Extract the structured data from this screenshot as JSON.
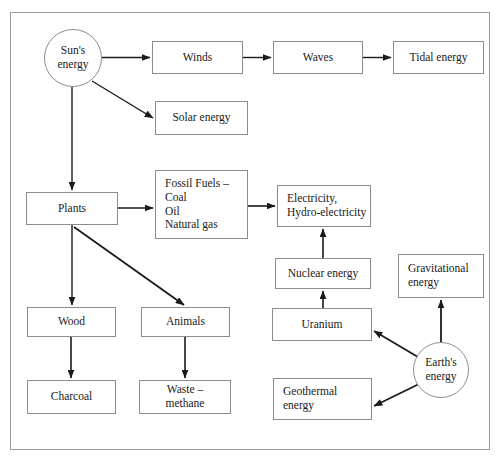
{
  "diagram": {
    "type": "flowchart",
    "background_color": "#ffffff",
    "frame_color": "#9a9a9a",
    "node_border_color": "#8d8d8d",
    "text_color": "#1a1a1a",
    "arrow_color": "#1a1a1a",
    "nodes": [
      {
        "id": "suns-energy",
        "label": "Sun's\nenergy",
        "shape": "ellipse",
        "x": 44,
        "y": 29,
        "w": 58,
        "h": 58,
        "font_size": 11.5,
        "align": "center"
      },
      {
        "id": "winds",
        "label": "Winds",
        "shape": "box",
        "x": 152,
        "y": 41,
        "w": 91,
        "h": 33,
        "font_size": 11.5,
        "align": "center"
      },
      {
        "id": "waves",
        "label": "Waves",
        "shape": "box",
        "x": 273,
        "y": 41,
        "w": 90,
        "h": 33,
        "font_size": 11.5,
        "align": "center"
      },
      {
        "id": "tidal-energy",
        "label": "Tidal energy",
        "shape": "box",
        "x": 393,
        "y": 41,
        "w": 91,
        "h": 33,
        "font_size": 11.5,
        "align": "center"
      },
      {
        "id": "solar-energy",
        "label": "Solar energy",
        "shape": "box",
        "x": 155,
        "y": 101,
        "w": 93,
        "h": 34,
        "font_size": 11.5,
        "align": "center"
      },
      {
        "id": "plants",
        "label": "Plants",
        "shape": "box",
        "x": 26,
        "y": 192,
        "w": 92,
        "h": 33,
        "font_size": 11.5,
        "align": "center"
      },
      {
        "id": "fossil-fuels",
        "label": "Fossil Fuels –\nCoal\nOil\nNatural gas",
        "shape": "box",
        "x": 155,
        "y": 170,
        "w": 93,
        "h": 69,
        "font_size": 11.5,
        "align": "left"
      },
      {
        "id": "electricity",
        "label": "Electricity,\nHydro-electricity",
        "shape": "box",
        "x": 277,
        "y": 185,
        "w": 94,
        "h": 42,
        "font_size": 11.5,
        "align": "left"
      },
      {
        "id": "nuclear-energy",
        "label": "Nuclear energy",
        "shape": "box",
        "x": 275,
        "y": 258,
        "w": 96,
        "h": 31,
        "font_size": 11.5,
        "align": "center"
      },
      {
        "id": "gravitational",
        "label": "Gravitational\nenergy",
        "shape": "box",
        "x": 398,
        "y": 254,
        "w": 86,
        "h": 44,
        "font_size": 11.5,
        "align": "left"
      },
      {
        "id": "uranium",
        "label": "Uranium",
        "shape": "box",
        "x": 272,
        "y": 308,
        "w": 100,
        "h": 33,
        "font_size": 11.5,
        "align": "center"
      },
      {
        "id": "wood",
        "label": "Wood",
        "shape": "box",
        "x": 27,
        "y": 307,
        "w": 89,
        "h": 30,
        "font_size": 11.5,
        "align": "center"
      },
      {
        "id": "animals",
        "label": "Animals",
        "shape": "box",
        "x": 141,
        "y": 307,
        "w": 89,
        "h": 30,
        "font_size": 11.5,
        "align": "center"
      },
      {
        "id": "earths-energy",
        "label": "Earth's\nenergy",
        "shape": "ellipse",
        "x": 413,
        "y": 342,
        "w": 56,
        "h": 56,
        "font_size": 11.5,
        "align": "center"
      },
      {
        "id": "charcoal",
        "label": "Charcoal",
        "shape": "box",
        "x": 27,
        "y": 380,
        "w": 89,
        "h": 34,
        "font_size": 11.5,
        "align": "center"
      },
      {
        "id": "waste-methane",
        "label": "Waste – methane",
        "shape": "box",
        "x": 139,
        "y": 380,
        "w": 92,
        "h": 34,
        "font_size": 11.5,
        "align": "center"
      },
      {
        "id": "geothermal",
        "label": "Geothermal\nenergy",
        "shape": "box",
        "x": 273,
        "y": 378,
        "w": 99,
        "h": 42,
        "font_size": 11.5,
        "align": "left"
      }
    ],
    "edges": [
      {
        "id": "suns-to-winds",
        "from": "suns-energy",
        "to": "winds",
        "from_label": "Sun's energy",
        "to_label": "Winds"
      },
      {
        "id": "winds-to-waves",
        "from": "winds",
        "to": "waves",
        "from_label": "Winds",
        "to_label": "Waves"
      },
      {
        "id": "waves-to-tidal",
        "from": "waves",
        "to": "tidal-energy",
        "from_label": "Waves",
        "to_label": "Tidal energy"
      },
      {
        "id": "suns-to-solar",
        "from": "suns-energy",
        "to": "solar-energy",
        "from_label": "Sun's energy",
        "to_label": "Solar energy"
      },
      {
        "id": "suns-to-plants",
        "from": "suns-energy",
        "to": "plants",
        "from_label": "Sun's energy",
        "to_label": "Plants"
      },
      {
        "id": "plants-to-fossil",
        "from": "plants",
        "to": "fossil-fuels",
        "from_label": "Plants",
        "to_label": "Fossil Fuels"
      },
      {
        "id": "fossil-to-electricity",
        "from": "fossil-fuels",
        "to": "electricity",
        "from_label": "Fossil Fuels",
        "to_label": "Electricity, Hydro-electricity"
      },
      {
        "id": "plants-to-wood",
        "from": "plants",
        "to": "wood",
        "from_label": "Plants",
        "to_label": "Wood"
      },
      {
        "id": "plants-to-animals",
        "from": "plants",
        "to": "animals",
        "from_label": "Plants",
        "to_label": "Animals"
      },
      {
        "id": "wood-to-charcoal",
        "from": "wood",
        "to": "charcoal",
        "from_label": "Wood",
        "to_label": "Charcoal"
      },
      {
        "id": "animals-to-waste",
        "from": "animals",
        "to": "waste-methane",
        "from_label": "Animals",
        "to_label": "Waste – methane"
      },
      {
        "id": "nuclear-to-electricity",
        "from": "nuclear-energy",
        "to": "electricity",
        "from_label": "Nuclear energy",
        "to_label": "Electricity, Hydro-electricity"
      },
      {
        "id": "uranium-to-nuclear",
        "from": "uranium",
        "to": "nuclear-energy",
        "from_label": "Uranium",
        "to_label": "Nuclear energy"
      },
      {
        "id": "earths-to-uranium",
        "from": "earths-energy",
        "to": "uranium",
        "from_label": "Earth's energy",
        "to_label": "Uranium"
      },
      {
        "id": "earths-to-gravitational",
        "from": "earths-energy",
        "to": "gravitational",
        "from_label": "Earth's energy",
        "to_label": "Gravitational energy"
      },
      {
        "id": "earths-to-geothermal",
        "from": "earths-energy",
        "to": "geothermal",
        "from_label": "Earth's energy",
        "to_label": "Geothermal energy"
      }
    ]
  }
}
